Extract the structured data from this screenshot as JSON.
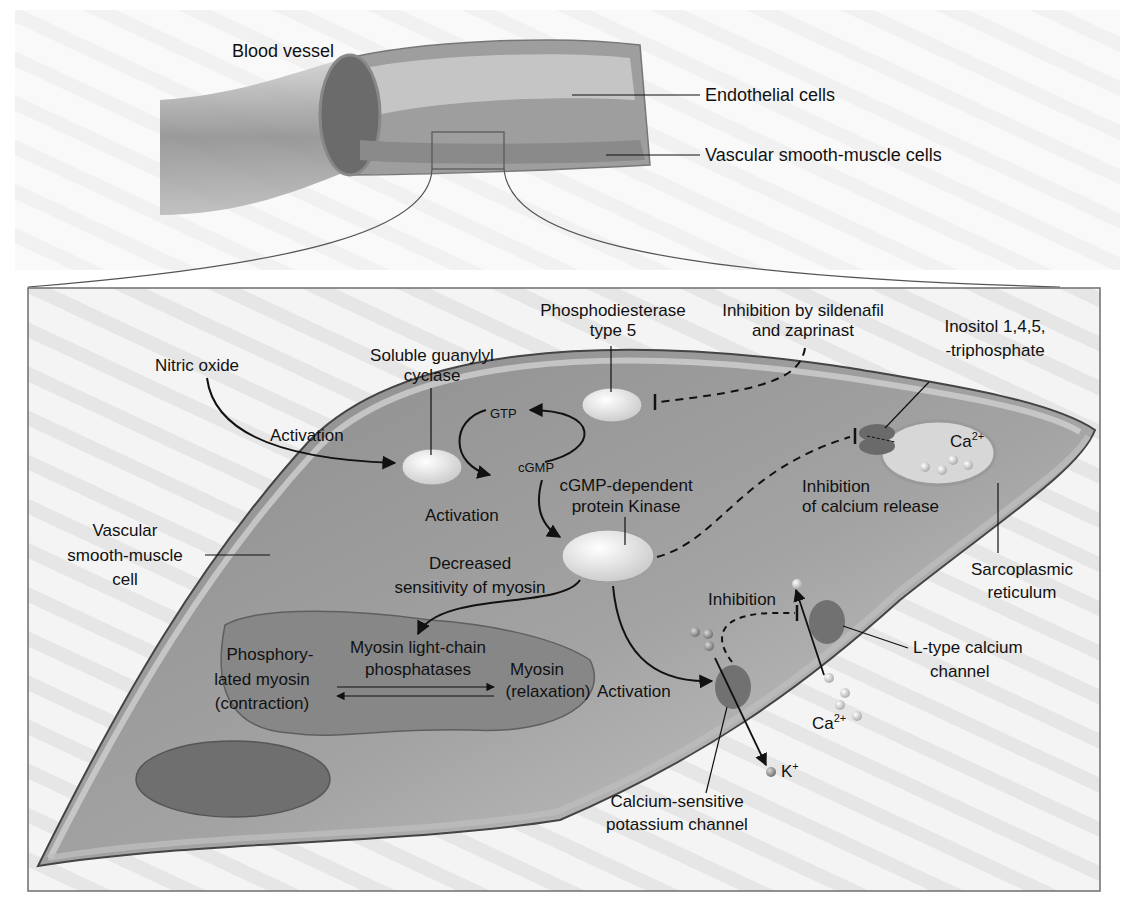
{
  "diagram": {
    "colors": {
      "background": "#ffffff",
      "panel_bg": "#ececec",
      "panel_border": "#6e6e6e",
      "cell_body": "#8e8e8e",
      "cell_membrane": "#b5b5b5",
      "cytoplasm_light": "#c8c8c8",
      "organelle": "#7d7d7d",
      "enzyme": "#e9e9e9",
      "channel": "#6a6a6a",
      "ion": "#cfcfcf",
      "arrow": "#111111"
    },
    "top_panel": {
      "labels": {
        "blood_vessel": "Blood vessel",
        "endothelial_cells": "Endothelial cells",
        "vascular_smooth_muscle_cells": "Vascular smooth-muscle cells"
      }
    },
    "cell_panel": {
      "labels": {
        "nitric_oxide": "Nitric oxide",
        "activation_1": "Activation",
        "soluble_guanylyl_cyclase_1": "Soluble guanylyl",
        "soluble_guanylyl_cyclase_2": "cyclase",
        "gtp": "GTP",
        "cgmp": "cGMP",
        "pde5_1": "Phosphodiesterase",
        "pde5_2": "type 5",
        "sildenafil_1": "Inhibition by sildenafil",
        "sildenafil_2": "and zaprinast",
        "ip3_1": "Inositol 1,4,5,",
        "ip3_2": "-triphosphate",
        "ca_sr": "Ca",
        "ca_sr_sup": "2+",
        "activation_2": "Activation",
        "pkg_1": "cGMP-dependent",
        "pkg_2": "protein Kinase",
        "inhib_ca_release_1": "Inhibition",
        "inhib_ca_release_2": "of calcium release",
        "vsmc_1": "Vascular",
        "vsmc_2": "smooth-muscle",
        "vsmc_3": "cell",
        "decreased_1": "Decreased",
        "decreased_2": "sensitivity of myosin",
        "sr_1": "Sarcoplasmic",
        "sr_2": "reticulum",
        "inhibition_ltype": "Inhibition",
        "phosphorylated_1": "Phosphory-",
        "phosphorylated_2": "lated myosin",
        "phosphorylated_3": "(contraction)",
        "mlcp_1": "Myosin light-chain",
        "mlcp_2": "phosphatases",
        "myosin_1": "Myosin",
        "myosin_2": "(relaxation)",
        "activation_3": "Activation",
        "ltype_1": "L-type calcium",
        "ltype_2": "channel",
        "ca_out": "Ca",
        "ca_out_sup": "2+",
        "k_ion": "K",
        "k_ion_sup": "+",
        "kca_1": "Calcium-sensitive",
        "kca_2": "potassium channel"
      }
    }
  }
}
